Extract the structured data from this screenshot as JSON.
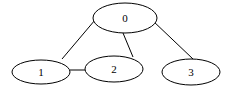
{
  "diagram": {
    "type": "undirected-graph",
    "nodes": [
      {
        "id": "0",
        "label": "0",
        "cx": 125,
        "cy": 18,
        "rx": 32,
        "ry": 15
      },
      {
        "id": "1",
        "label": "1",
        "cx": 41,
        "cy": 72,
        "rx": 29,
        "ry": 12
      },
      {
        "id": "2",
        "label": "2",
        "cx": 114,
        "cy": 69,
        "rx": 29,
        "ry": 13
      },
      {
        "id": "3",
        "label": "3",
        "cx": 191,
        "cy": 72,
        "rx": 29,
        "ry": 13
      }
    ],
    "edges": [
      {
        "from": "0",
        "to": "1"
      },
      {
        "from": "0",
        "to": "2"
      },
      {
        "from": "0",
        "to": "3"
      },
      {
        "from": "1",
        "to": "2"
      }
    ],
    "stroke_color": "#000000",
    "background": "#ffffff"
  }
}
